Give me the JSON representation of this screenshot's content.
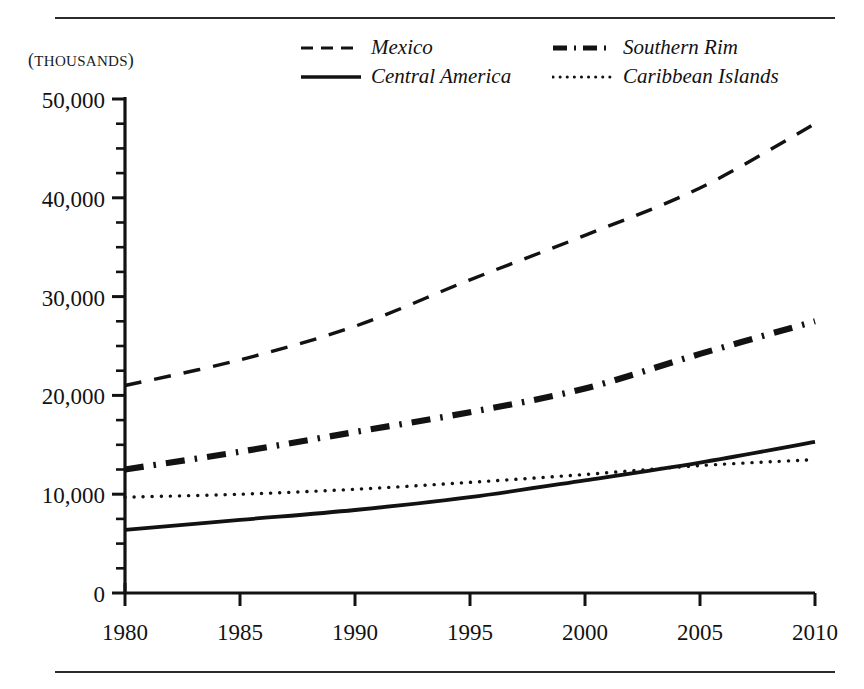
{
  "figure": {
    "units_caption": "(THOUSANDS)",
    "units_caption_open": "(",
    "units_caption_text": "THOUSANDS",
    "units_caption_close": ")",
    "clipped_caption_above": "",
    "frame_color": "#2b2b2b",
    "ink_color": "#121212",
    "background": "#ffffff"
  },
  "legend": {
    "position": "top-center",
    "columns": 2,
    "items": [
      {
        "label": "Mexico",
        "style": "dashed",
        "swatch": "dashed-line-swatch"
      },
      {
        "label": "Southern Rim",
        "style": "dash-dot-thick",
        "swatch": "dash-dot-line-swatch"
      },
      {
        "label": "Central America",
        "style": "solid",
        "swatch": "solid-line-swatch"
      },
      {
        "label": "Caribbean Islands",
        "style": "dotted",
        "swatch": "dotted-line-swatch"
      }
    ]
  },
  "axes": {
    "y_ticks": [
      "50,000",
      "40,000",
      "30,000",
      "20,000",
      "10,000",
      "0"
    ],
    "y_tick_values": [
      50000,
      40000,
      30000,
      20000,
      10000,
      0
    ],
    "y_minor_step": 2500,
    "x_ticks": [
      "1980",
      "1985",
      "1990",
      "1995",
      "2000",
      "2005",
      "2010"
    ],
    "x_tick_values": [
      1980,
      1985,
      1990,
      1995,
      2000,
      2005,
      2010
    ]
  },
  "chart_data": {
    "type": "line",
    "title": "",
    "subtitle": "",
    "xlabel": "",
    "ylabel": "(THOUSANDS)",
    "xlim": [
      1980,
      2010
    ],
    "ylim": [
      0,
      50000
    ],
    "grid": false,
    "legend_position": "top-center",
    "x": [
      1980,
      1985,
      1990,
      1995,
      2000,
      2005,
      2010
    ],
    "series": [
      {
        "name": "Mexico",
        "style": "dashed",
        "values": [
          21000,
          23600,
          27000,
          31700,
          36200,
          41000,
          47500
        ]
      },
      {
        "name": "Southern Rim",
        "style": "dash-dot-thick",
        "values": [
          12500,
          14300,
          16300,
          18300,
          20700,
          24200,
          27500
        ]
      },
      {
        "name": "Central America",
        "style": "solid",
        "values": [
          6400,
          7400,
          8400,
          9700,
          11400,
          13200,
          15300
        ]
      },
      {
        "name": "Caribbean Islands",
        "style": "dotted",
        "values": [
          9700,
          10000,
          10500,
          11200,
          12000,
          12900,
          13500
        ]
      }
    ],
    "notes": [
      "Central America crosses above Caribbean Islands near 2005",
      "All four series increase monotonically from 1980 to 2010"
    ]
  }
}
